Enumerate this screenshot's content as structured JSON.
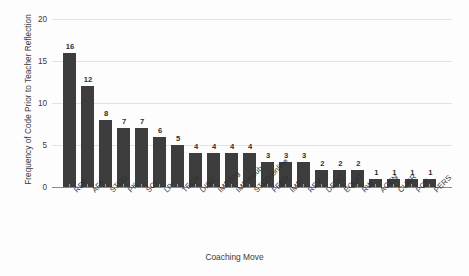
{
  "chart_data": {
    "type": "bar",
    "title": "",
    "xlabel": "Coaching Move",
    "ylabel": "Frequency of Code Prior to Teacher Reflection",
    "categories": [
      "REF",
      "AFF",
      "STUD",
      "PK",
      "SCI",
      "LP",
      "TECH",
      "DISC",
      "IMP-log",
      "IMP-troub",
      "STUD-online",
      "FEED",
      "IMP",
      "REV",
      "DESC",
      "EQUIT",
      "RW",
      "AGEN",
      "CURR",
      "PCK",
      "PERS"
    ],
    "values": [
      16,
      12,
      8,
      7,
      7,
      6,
      5,
      4,
      4,
      4,
      4,
      3,
      3,
      3,
      2,
      2,
      2,
      1,
      1,
      1,
      1
    ],
    "ylim": [
      0,
      20
    ],
    "yticks": [
      0,
      5,
      10,
      15,
      20
    ],
    "ytick_labels": [
      "0",
      "5",
      "10",
      "15",
      "20"
    ],
    "grid": true,
    "legend": "none",
    "bar_color": "#3d3d3d",
    "gridline_color": "#e2e2e2",
    "background_color": "#fdfdfd",
    "value_labels_shown": true
  }
}
